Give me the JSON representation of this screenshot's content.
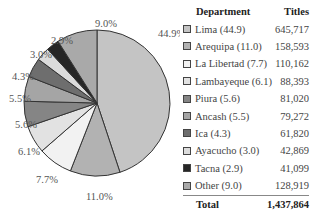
{
  "chart_data": {
    "type": "pie",
    "title": "",
    "categories": [
      "Lima",
      "Arequipa",
      "La Libertad",
      "Lambayeque",
      "Piura",
      "Ancash",
      "Ica",
      "Ayacucho",
      "Tacna",
      "Other"
    ],
    "values": [
      645717,
      158593,
      110162,
      88393,
      81020,
      79272,
      61820,
      42869,
      41099,
      128919
    ],
    "percentages": [
      44.9,
      11.0,
      7.7,
      6.1,
      5.6,
      5.5,
      4.3,
      3.0,
      2.9,
      9.0
    ],
    "colors": [
      "#c4c4c4",
      "#b2b2b2",
      "#f2f2f2",
      "#e2e2e2",
      "#858585",
      "#a5a5a5",
      "#6e6e6e",
      "#dcdcdc",
      "#262626",
      "#a9a9a9"
    ],
    "total": 1437864,
    "slice_labels": [
      "44.9%",
      "11.0%",
      "7.7%",
      "6.1%",
      "5.6%",
      "5.5%",
      "4.3%",
      "3.0%",
      "2.9%",
      "9.0%"
    ],
    "start_angle_deg": 0,
    "direction": "clockwise"
  },
  "legend": {
    "header": {
      "department": "Department",
      "titles": "Titles"
    },
    "rows": [
      {
        "label": "Lima (44.9)",
        "value": "645,717"
      },
      {
        "label": "Arequipa (11.0)",
        "value": "158,593"
      },
      {
        "label": "La Libertad (7.7)",
        "value": "110,162"
      },
      {
        "label": "Lambayeque (6.1)",
        "value": "88,393"
      },
      {
        "label": "Piura (5.6)",
        "value": "81,020"
      },
      {
        "label": "Ancash (5.5)",
        "value": "79,272"
      },
      {
        "label": "Ica (4.3)",
        "value": "61,820"
      },
      {
        "label": "Ayacucho (3.0)",
        "value": "42,869"
      },
      {
        "label": "Tacna (2.9)",
        "value": "41,099"
      },
      {
        "label": "Other (9.0)",
        "value": "128,919"
      }
    ],
    "total": {
      "label": "Total",
      "value": "1,437,864"
    }
  }
}
